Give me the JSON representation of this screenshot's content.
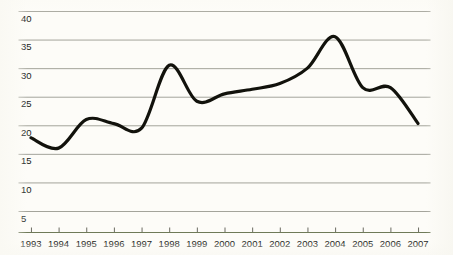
{
  "chart_data": {
    "type": "line",
    "title": "",
    "subtitle": "",
    "xlabel": "",
    "ylabel": "",
    "categories": [
      "1993",
      "1994",
      "1995",
      "1996",
      "1997",
      "1998",
      "1999",
      "2000",
      "2001",
      "2002",
      "2003",
      "2004",
      "2005",
      "2006",
      "2007"
    ],
    "x": [
      1993,
      1994,
      1995,
      1996,
      1997,
      1998,
      1999,
      2000,
      2001,
      2002,
      2003,
      2004,
      2005,
      2006,
      2007
    ],
    "values": [
      17.8,
      16.0,
      21.0,
      20.3,
      19.5,
      30.5,
      24.2,
      25.5,
      26.3,
      27.3,
      30.0,
      35.5,
      26.6,
      26.6,
      20.3
    ],
    "series": [
      {
        "name": "series-1",
        "values": [
          17.8,
          16.0,
          21.0,
          20.3,
          19.5,
          30.5,
          24.2,
          25.5,
          26.3,
          27.3,
          30.0,
          35.5,
          26.6,
          26.6,
          20.3
        ],
        "color": "#12120c",
        "line_width": 3.2,
        "smoothing": "spline"
      }
    ],
    "ylim": [
      3.2,
      41.5
    ],
    "xlim": [
      1992.55,
      2007.45
    ],
    "y_ticks": [
      5,
      10,
      15,
      20,
      25,
      30,
      35,
      40
    ],
    "y_tick_labels": [
      "5",
      "10",
      "15",
      "20",
      "25",
      "30",
      "35",
      "40"
    ],
    "x_ticks": [
      1993,
      1994,
      1995,
      1996,
      1997,
      1998,
      1999,
      2000,
      2001,
      2002,
      2003,
      2004,
      2005,
      2006,
      2007
    ],
    "grid": {
      "horizontal": true,
      "vertical": false,
      "color": "#9a9a90",
      "width": 0.9
    },
    "axis": {
      "baseline_color": "#6f7a58",
      "baseline_width": 1.2,
      "tick_color": "#5a5a50",
      "tick_length": 5
    },
    "legend": {
      "visible": false,
      "position": "none"
    },
    "annotations": [],
    "background_color": "#fdfcf8",
    "text_color": "#1c1c18"
  }
}
